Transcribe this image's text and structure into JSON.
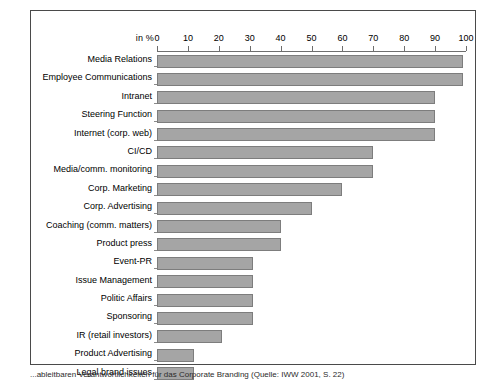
{
  "caption": "...ableitbaren Verantwortlichkeiten für das Corporate Branding (Quelle: IWW 2001, S. 22)",
  "chart_data": {
    "type": "bar",
    "orientation": "horizontal",
    "title": "",
    "xlabel": "in %",
    "ylabel": "",
    "xlim": [
      0,
      100
    ],
    "xticks": [
      0,
      10,
      20,
      30,
      40,
      50,
      60,
      70,
      80,
      90,
      100
    ],
    "grid": false,
    "legend": null,
    "bar_color": "#a5a5a5",
    "bar_border_color": "#7d7d7d",
    "categories": [
      "Media Relations",
      "Employee Communications",
      "Intranet",
      "Steering Function",
      "Internet (corp. web)",
      "CI/CD",
      "Media/comm. monitoring",
      "Corp. Marketing",
      "Corp. Advertising",
      "Coaching (comm. matters)",
      "Product press",
      "Event-PR",
      "Issue Management",
      "Politic Affairs",
      "Sponsoring",
      "IR (retail investors)",
      "Product Advertising",
      "Legal brand issues"
    ],
    "values": [
      99,
      99,
      90,
      90,
      90,
      70,
      70,
      60,
      50,
      40,
      40,
      31,
      31,
      31,
      31,
      21,
      12,
      12
    ]
  }
}
